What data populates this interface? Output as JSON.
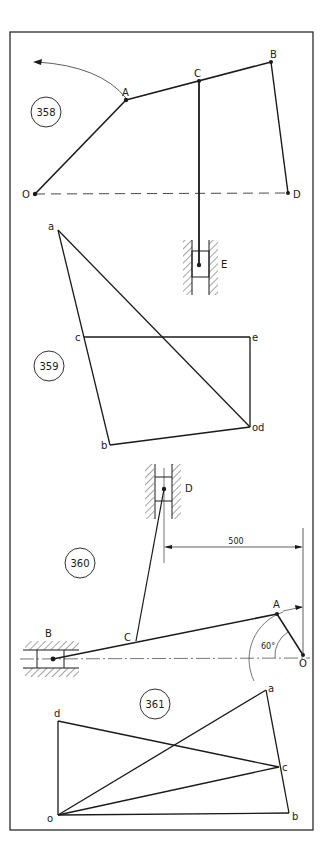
{
  "figures": [
    {
      "number": "358",
      "points": {
        "O": "O",
        "A": "A",
        "B": "B",
        "C": "C",
        "D": "D",
        "E": "E"
      }
    },
    {
      "number": "359",
      "points": {
        "a": "a",
        "b": "b",
        "c": "c",
        "d": "od",
        "e": "e"
      }
    },
    {
      "number": "360",
      "points": {
        "A": "A",
        "B": "B",
        "C": "C",
        "D": "D",
        "O": "O"
      },
      "dimension": "500",
      "angle": "60°"
    },
    {
      "number": "361",
      "points": {
        "a": "a",
        "b": "b",
        "c": "c",
        "d": "d",
        "o": "o"
      }
    }
  ]
}
